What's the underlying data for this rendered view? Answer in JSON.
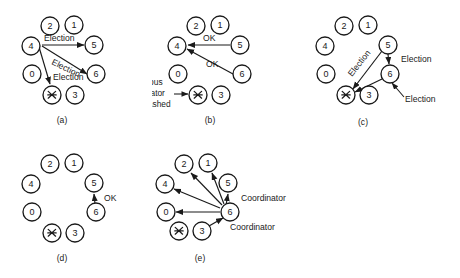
{
  "figure": {
    "nodes": [
      {
        "id": "2",
        "label": "2"
      },
      {
        "id": "1",
        "label": "1"
      },
      {
        "id": "5",
        "label": "5"
      },
      {
        "id": "6",
        "label": "6"
      },
      {
        "id": "3",
        "label": "3"
      },
      {
        "id": "crashed",
        "label": "crashed-process-icon"
      },
      {
        "id": "0",
        "label": "0"
      },
      {
        "id": "4",
        "label": "4"
      }
    ],
    "ring_order": [
      "2",
      "1",
      "5",
      "6",
      "3",
      "crashed",
      "0",
      "4"
    ],
    "message_labels": {
      "election": "Election",
      "ok": "OK",
      "coordinator": "Coordinator"
    },
    "panels": [
      {
        "key": "a",
        "caption": "(a)",
        "messages": [
          {
            "from": "4",
            "to": "5",
            "label": "Election"
          },
          {
            "from": "4",
            "to": "6",
            "label": "Election"
          },
          {
            "from": "4",
            "to": "crashed",
            "label": "Election"
          }
        ]
      },
      {
        "key": "b",
        "caption": "(b)",
        "messages": [
          {
            "from": "5",
            "to": "4",
            "label": "OK"
          },
          {
            "from": "6",
            "to": "4",
            "label": "OK"
          }
        ],
        "annotation": {
          "line1": "Previous",
          "line2": "coordinator",
          "line3": "has crashed",
          "target": "crashed"
        }
      },
      {
        "key": "c",
        "caption": "(c)",
        "messages": [
          {
            "from": "5",
            "to": "crashed",
            "label": "Election"
          },
          {
            "from": "5",
            "to": "6",
            "label": "Election"
          },
          {
            "from": "6",
            "to": "crashed",
            "label": "Election"
          }
        ]
      },
      {
        "key": "d",
        "caption": "(d)",
        "messages": [
          {
            "from": "6",
            "to": "5",
            "label": "OK"
          }
        ]
      },
      {
        "key": "e",
        "caption": "(e)",
        "messages": [
          {
            "from": "6",
            "to": "5",
            "label": "Coordinator"
          },
          {
            "from": "6",
            "to": "1",
            "label": ""
          },
          {
            "from": "6",
            "to": "2",
            "label": ""
          },
          {
            "from": "6",
            "to": "4",
            "label": ""
          },
          {
            "from": "6",
            "to": "0",
            "label": ""
          },
          {
            "from": "6",
            "to": "3",
            "label": "Coordinator"
          }
        ]
      }
    ],
    "colors": {
      "ink": "#1a1a1a",
      "paper": "#ffffff"
    }
  }
}
